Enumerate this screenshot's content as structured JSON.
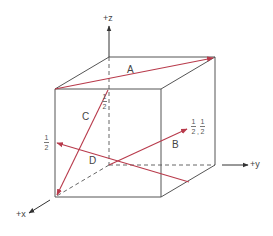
{
  "diagram": {
    "type": "unit cell with direction vectors",
    "colors": {
      "cube_edge": "#555555",
      "vector": "#b83a4b",
      "axis": "#333333",
      "hidden": "#666666"
    },
    "axes": [
      {
        "id": "z",
        "label": "+z"
      },
      {
        "id": "y",
        "label": "+y"
      },
      {
        "id": "x",
        "label": "+x"
      }
    ],
    "vectors": [
      {
        "id": "A",
        "label": "A"
      },
      {
        "id": "B",
        "label": "B"
      },
      {
        "id": "C",
        "label": "C"
      },
      {
        "id": "D",
        "label": "D"
      }
    ],
    "fractions": {
      "c_top": {
        "num": "1",
        "den": "2"
      },
      "d_left": {
        "num": "1",
        "den": "2"
      },
      "b_end": [
        {
          "num": "1",
          "den": "2"
        },
        {
          "num": "1",
          "den": "2"
        }
      ],
      "separator": ","
    }
  }
}
